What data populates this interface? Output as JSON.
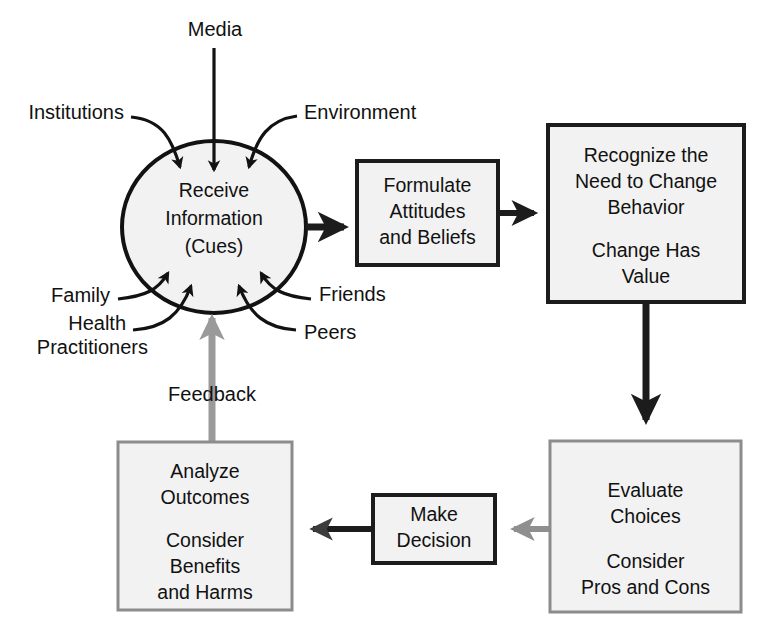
{
  "diagram": {
    "type": "flowchart",
    "background_color": "#ffffff",
    "colors": {
      "node_fill": "#f2f2f2",
      "dark_stroke": "#1c1c1c",
      "gray_stroke": "#8f8f8f",
      "text": "#111111"
    },
    "central_node": {
      "shape": "circle",
      "lines": [
        "Receive",
        "Information",
        "(Cues)"
      ],
      "line1": "Receive",
      "line2": "Information",
      "line3": "(Cues)"
    },
    "cue_sources": [
      {
        "label": "Media",
        "position": "top",
        "arrow_color": "#121212"
      },
      {
        "label": "Institutions",
        "position": "upper-left",
        "arrow_color": "#121212"
      },
      {
        "label": "Environment",
        "position": "upper-right",
        "arrow_color": "#121212"
      },
      {
        "label": "Family",
        "position": "lower-left",
        "arrow_color": "#121212"
      },
      {
        "label": "Health",
        "position": "lower-left-2",
        "arrow_color": "#121212"
      },
      {
        "label": "Practitioners",
        "position": "lower-left-2b",
        "arrow_color": "#121212"
      },
      {
        "label": "Friends",
        "position": "lower-right",
        "arrow_color": "#121212"
      },
      {
        "label": "Peers",
        "position": "lower-right-2",
        "arrow_color": "#121212"
      }
    ],
    "feedback": {
      "label": "Feedback",
      "arrow_color": "#9a9a9a",
      "from": "Analyze Outcomes",
      "to": "Receive Information (Cues)"
    },
    "boxes": [
      {
        "id": "formulate",
        "border": "dark",
        "lines": [
          "Formulate",
          "Attitudes",
          "and Beliefs"
        ],
        "line1": "Formulate",
        "line2": "Attitudes",
        "line3": "and Beliefs"
      },
      {
        "id": "recognize",
        "border": "dark",
        "lines": [
          "Recognize the",
          "Need to Change",
          "Behavior",
          "",
          "Change Has",
          "Value"
        ],
        "line1": "Recognize the",
        "line2": "Need to Change",
        "line3": "Behavior",
        "line4": "Change Has",
        "line5": "Value"
      },
      {
        "id": "evaluate",
        "border": "gray",
        "lines": [
          "Evaluate",
          "Choices",
          "",
          "Consider",
          "Pros and Cons"
        ],
        "line1": "Evaluate",
        "line2": "Choices",
        "line3": "Consider",
        "line4": "Pros and Cons"
      },
      {
        "id": "decision",
        "border": "dark",
        "lines": [
          "Make",
          "Decision"
        ],
        "line1": "Make",
        "line2": "Decision"
      },
      {
        "id": "analyze",
        "border": "gray",
        "lines": [
          "Analyze",
          "Outcomes",
          "",
          "Consider",
          "Benefits",
          "and Harms"
        ],
        "line1": "Analyze",
        "line2": "Outcomes",
        "line3": "Consider",
        "line4": "Benefits",
        "line5": "and Harms"
      }
    ],
    "connections": [
      {
        "from": "cues",
        "to": "formulate",
        "color": "#1c1c1c",
        "direction": "right"
      },
      {
        "from": "formulate",
        "to": "recognize",
        "color": "#1c1c1c",
        "direction": "right"
      },
      {
        "from": "recognize",
        "to": "evaluate",
        "color": "#1c1c1c",
        "direction": "down"
      },
      {
        "from": "evaluate",
        "to": "decision",
        "color": "#8f8f8f",
        "direction": "left"
      },
      {
        "from": "decision",
        "to": "analyze",
        "color": "#4a4a4a",
        "direction": "left"
      },
      {
        "from": "analyze",
        "to": "cues",
        "color": "#9a9a9a",
        "direction": "up"
      }
    ]
  }
}
